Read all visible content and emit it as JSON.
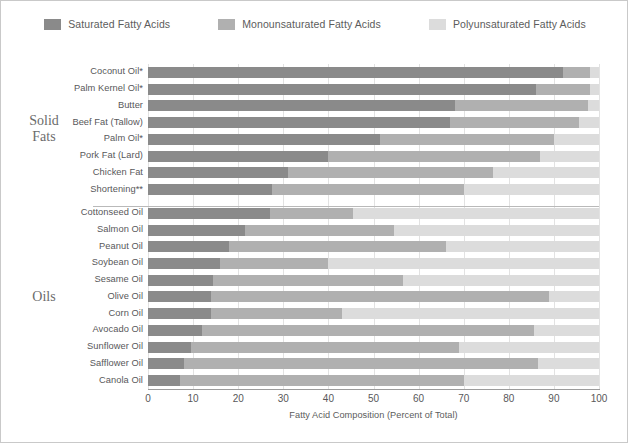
{
  "legend": {
    "items": [
      {
        "label": "Saturated Fatty Acids",
        "color": "#8a8a8a",
        "key": "saturated"
      },
      {
        "label": "Monounsaturated Fatty Acids",
        "color": "#b0b0b0",
        "key": "monounsaturated"
      },
      {
        "label": "Polyunsaturated Fatty Acids",
        "color": "#dcdcdc",
        "key": "polyunsaturated"
      }
    ]
  },
  "groups": [
    {
      "name": "solid-fats",
      "line1": "Solid",
      "line2": "Fats"
    },
    {
      "name": "oils",
      "line1": "Oils",
      "line2": ""
    }
  ],
  "axis": {
    "x_title": "Fatty Acid Composition (Percent of Total)",
    "ticks": [
      0,
      10,
      20,
      30,
      40,
      50,
      60,
      70,
      80,
      90,
      100
    ]
  },
  "chart_data": {
    "type": "bar",
    "orientation": "horizontal",
    "stacked": true,
    "title": "",
    "xlabel": "Fatty Acid Composition (Percent of Total)",
    "ylabel": "",
    "xlim": [
      0,
      100
    ],
    "grid": true,
    "legend_position": "top",
    "categories": [
      "Coconut Oil*",
      "Palm Kernel Oil*",
      "Butter",
      "Beef Fat (Tallow)",
      "Palm Oil*",
      "Pork Fat (Lard)",
      "Chicken Fat",
      "Shortening**",
      "Cottonseed  Oil",
      "Salmon Oil",
      "Peanut Oil",
      "Soybean Oil",
      "Sesame Oil",
      "Olive Oil",
      "Corn Oil",
      "Avocado Oil",
      "Sunflower Oil",
      "Safflower Oil",
      "Canola Oil"
    ],
    "group_of_category": [
      "Solid Fats",
      "Solid Fats",
      "Solid Fats",
      "Solid Fats",
      "Solid Fats",
      "Solid Fats",
      "Solid Fats",
      "Solid Fats",
      "Oils",
      "Oils",
      "Oils",
      "Oils",
      "Oils",
      "Oils",
      "Oils",
      "Oils",
      "Oils",
      "Oils",
      "Oils"
    ],
    "series": [
      {
        "name": "Saturated Fatty Acids",
        "color": "#8a8a8a",
        "values": [
          92,
          86,
          68,
          67,
          51.5,
          40,
          31,
          27.5,
          27,
          21.5,
          18,
          16,
          14.5,
          14,
          14,
          12,
          9.5,
          8,
          7
        ]
      },
      {
        "name": "Monounsaturated Fatty Acids",
        "color": "#b0b0b0",
        "values": [
          6,
          12,
          29.5,
          28.5,
          38.5,
          47,
          45.5,
          42.5,
          18.5,
          33,
          48,
          24,
          42,
          75,
          29,
          73.5,
          59.5,
          78.5,
          63
        ]
      },
      {
        "name": "Polyunsaturated Fatty Acids",
        "color": "#dcdcdc",
        "values": [
          2,
          2,
          2.5,
          4.5,
          10,
          13,
          23.5,
          30,
          54.5,
          45.5,
          34,
          60,
          43.5,
          11,
          57,
          14.5,
          31,
          13.5,
          30
        ]
      }
    ]
  }
}
